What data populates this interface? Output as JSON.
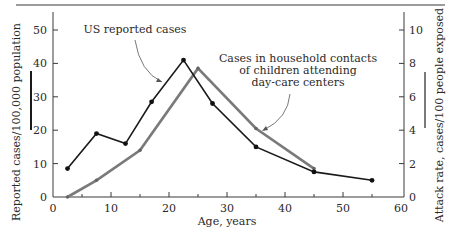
{
  "chart_data": {
    "type": "line",
    "title": "",
    "xlabel": "Age, years",
    "ylabel_left": "Reported cases/100,000 population",
    "ylabel_right": "Attack rate, cases/100 people exposed",
    "xlim": [
      0,
      60
    ],
    "ylim_left": [
      0,
      50
    ],
    "ylim_right": [
      0,
      10
    ],
    "x_ticks": [
      0,
      10,
      20,
      30,
      40,
      50,
      60
    ],
    "x_minor_ticks": [
      5,
      15,
      25,
      35,
      45,
      55
    ],
    "y_ticks_left": [
      0,
      10,
      20,
      30,
      40,
      50
    ],
    "y_ticks_right": [
      0,
      2,
      4,
      6,
      8,
      10
    ],
    "grid": false,
    "series": [
      {
        "name": "US reported cases",
        "axis": "left",
        "color": "#1a1a1a",
        "x": [
          2.5,
          7.5,
          12.5,
          17,
          22.5,
          27.5,
          35,
          45,
          55
        ],
        "y": [
          8.5,
          19,
          16,
          28.5,
          41,
          28,
          15,
          7.5,
          5
        ]
      },
      {
        "name": "Cases in household contacts of children attending day-care centers",
        "axis": "right",
        "color": "#7a7a7a",
        "x": [
          2.5,
          7.5,
          15,
          25,
          35,
          45
        ],
        "y": [
          0,
          1.0,
          2.8,
          7.7,
          4.1,
          1.7
        ]
      }
    ],
    "annotations": [
      {
        "text": "US reported cases",
        "target_series": 0
      },
      {
        "lines": [
          "Cases in household contacts",
          "of children attending",
          "day-care centers"
        ],
        "target_series": 1
      }
    ]
  }
}
